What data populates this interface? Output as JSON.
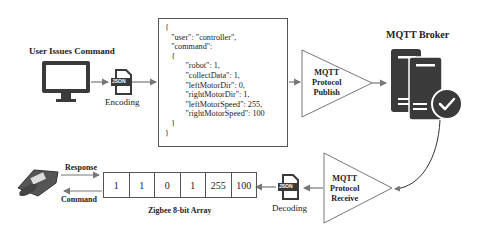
{
  "title_user": "User Issues Command",
  "encoding_label": "Encoding",
  "decoding_label": "Decoding",
  "json_badge": "JSON",
  "json_lines": [
    "{",
    "   \"user\": \"controller\",",
    "   \"command\":",
    "   {",
    "          \"robot\": 1,",
    "          \"collectData\": 1,",
    "          \"leftMotorDir\": 0,",
    "          \"rightMotorDir\": 1,",
    "          \"leftMotorSpeed\": 255,",
    "          \"rightMotorSpeed\": 100",
    "   }",
    "}"
  ],
  "publish": {
    "line1": "MQTT",
    "line2": "Protocol",
    "line3": "Publish"
  },
  "receive": {
    "line1": "MQTT",
    "line2": "Protocol",
    "line3": "Receive"
  },
  "broker_label": "MQTT Broker",
  "response_label": "Response",
  "command_label": "Command",
  "array_label": "Zigbee 8-bit Array",
  "array_values": [
    "1",
    "1",
    "0",
    "1",
    "255",
    "100"
  ],
  "colors": {
    "icon": "#3a3a3a",
    "arrow": "#777777",
    "border": "#555555"
  }
}
